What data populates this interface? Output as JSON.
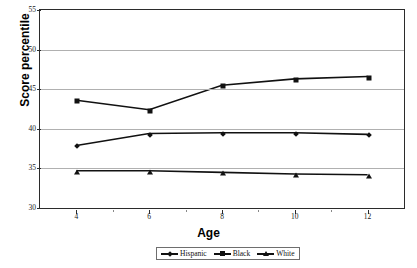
{
  "chart_data": {
    "type": "line",
    "title": "",
    "xlabel": "Age",
    "ylabel": "Score percentile",
    "x": [
      4,
      6,
      8,
      10,
      12
    ],
    "xticklabels": [
      "4",
      "6",
      "8",
      "10",
      "12"
    ],
    "yticklabels": [
      "30",
      "35",
      "40",
      "45",
      "50",
      "55"
    ],
    "yticks": [
      30,
      35,
      40,
      45,
      50,
      55
    ],
    "xlim": [
      3,
      13
    ],
    "ylim": [
      30,
      55
    ],
    "grid": "horizontal",
    "legend_position": "bottom-center",
    "series": [
      {
        "name": "Hispanic",
        "marker": "diamond",
        "color": "#111111",
        "values": [
          37.9,
          39.4,
          39.5,
          39.5,
          39.3
        ]
      },
      {
        "name": "Black",
        "marker": "square",
        "color": "#111111",
        "values": [
          43.6,
          42.4,
          45.5,
          46.3,
          46.6
        ]
      },
      {
        "name": "White",
        "marker": "triangle",
        "color": "#111111",
        "values": [
          34.7,
          34.7,
          34.5,
          34.3,
          34.2
        ]
      }
    ]
  },
  "legend": {
    "items": [
      {
        "label": "Hispanic",
        "marker": "diamond-marker-icon"
      },
      {
        "label": "Black",
        "marker": "square-marker-icon"
      },
      {
        "label": "White",
        "marker": "triangle-marker-icon"
      }
    ]
  },
  "axes": {
    "y_title": "Score percentile",
    "x_title": "Age"
  }
}
